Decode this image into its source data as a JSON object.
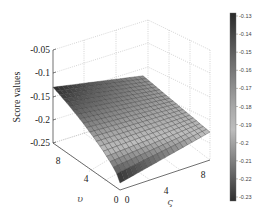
{
  "chart_data": {
    "type": "surface3d",
    "title": "",
    "xlabel": "υ",
    "ylabel": "ς",
    "zlabel": "Score values",
    "x_ticks": [
      "0",
      "4",
      "8"
    ],
    "y_ticks": [
      "0",
      "4",
      "8"
    ],
    "z_ticks": [
      "-0.05",
      "-0.1",
      "-0.15",
      "-0.2",
      "-0.25"
    ],
    "zlim": [
      -0.25,
      -0.05
    ],
    "xlim": [
      0,
      10
    ],
    "ylim": [
      0,
      10
    ],
    "grid": true,
    "colormap": "gray",
    "colorbar": {
      "ticks": [
        "-0.13",
        "-0.14",
        "-0.15",
        "-0.16",
        "-0.17",
        "-0.18",
        "-0.19",
        "-0.2",
        "-0.21",
        "-0.22",
        "-0.23"
      ],
      "range": [
        -0.23,
        -0.13
      ],
      "position": "right"
    },
    "surface_description": "Score surface over (υ, ς) in [0,10]x[0,10]; highest (~-0.13) at υ=10, ς=0 corner, dropping to ~-0.23 at υ=0, ς=0 corner; approx -0.17 to -0.19 across the far (ς=10) edge",
    "corner_values": {
      "u0_s0": -0.235,
      "u10_s0": -0.13,
      "u0_s10": -0.19,
      "u10_s10": -0.17
    }
  },
  "labels": {
    "zlabel": "Score values",
    "xlabel": "υ",
    "ylabel": "ς",
    "x_origin": "0",
    "y_origin": "0",
    "x4": "4",
    "x8": "8",
    "y4": "4",
    "y8": "8",
    "z1": "-0.05",
    "z2": "-0.1",
    "z3": "-0.15",
    "z4": "-0.2",
    "z5": "-0.25",
    "cb0": "-0.13",
    "cb1": "-0.14",
    "cb2": "-0.15",
    "cb3": "-0.16",
    "cb4": "-0.17",
    "cb5": "-0.18",
    "cb6": "-0.19",
    "cb7": "-0.2",
    "cb8": "-0.21",
    "cb9": "-0.22",
    "cb10": "-0.23"
  }
}
